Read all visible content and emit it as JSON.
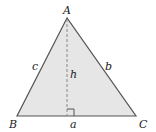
{
  "diagram": {
    "type": "triangle-with-altitude",
    "vertices": {
      "A": {
        "label": "A",
        "x": 67,
        "y": 18
      },
      "B": {
        "label": "B",
        "x": 17,
        "y": 116
      },
      "C": {
        "label": "C",
        "x": 136,
        "y": 116
      }
    },
    "sides": {
      "a": "a",
      "b": "b",
      "c": "c"
    },
    "altitude_label": "h",
    "colors": {
      "fill": "#e6e6e6",
      "stroke": "#444444",
      "dashed": "#777777"
    }
  }
}
